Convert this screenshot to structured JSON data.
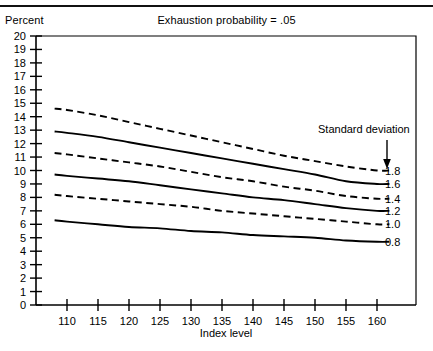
{
  "header": {
    "clipped_text": "",
    "percent_label": "Percent"
  },
  "chart_data": {
    "type": "line",
    "title": "Exhaustion probability = .05",
    "xlabel": "Index level",
    "ylabel": "Percent",
    "xlim": [
      108,
      163
    ],
    "ylim": [
      0,
      20
    ],
    "xticks": [
      110,
      115,
      120,
      125,
      130,
      135,
      140,
      145,
      150,
      155,
      160
    ],
    "yticks": [
      0,
      1,
      2,
      3,
      4,
      5,
      6,
      7,
      8,
      9,
      10,
      11,
      12,
      13,
      14,
      15,
      16,
      17,
      18,
      19,
      20
    ],
    "grid": false,
    "legend_position": "right-inline",
    "legend_title": "Standard deviation",
    "annotation_arrow": "down-arrow-icon",
    "x": [
      108,
      110,
      115,
      120,
      125,
      130,
      135,
      140,
      145,
      150,
      155,
      160,
      162
    ],
    "series": [
      {
        "name": "1.8",
        "label": "1.8",
        "style": "dashed",
        "values": [
          14.6,
          14.5,
          14.1,
          13.6,
          13.1,
          12.6,
          12.1,
          11.6,
          11.1,
          10.7,
          10.3,
          10.0,
          10.0
        ]
      },
      {
        "name": "1.6",
        "label": "1.6",
        "style": "solid",
        "values": [
          12.9,
          12.8,
          12.5,
          12.1,
          11.7,
          11.3,
          10.9,
          10.5,
          10.1,
          9.7,
          9.2,
          9.0,
          9.0
        ]
      },
      {
        "name": "1.4",
        "label": "1.4",
        "style": "dashed",
        "values": [
          11.3,
          11.2,
          10.9,
          10.6,
          10.3,
          9.9,
          9.5,
          9.2,
          8.8,
          8.5,
          8.1,
          7.9,
          7.9
        ]
      },
      {
        "name": "1.2",
        "label": "1.2",
        "style": "solid",
        "values": [
          9.7,
          9.6,
          9.4,
          9.2,
          8.9,
          8.6,
          8.3,
          8.0,
          7.8,
          7.5,
          7.2,
          7.0,
          7.0
        ]
      },
      {
        "name": "1.0",
        "label": "1.0",
        "style": "dashed",
        "values": [
          8.2,
          8.1,
          7.9,
          7.7,
          7.5,
          7.3,
          7.0,
          6.8,
          6.6,
          6.4,
          6.2,
          6.0,
          6.0
        ]
      },
      {
        "name": "0.8",
        "label": "0.8",
        "style": "solid",
        "values": [
          6.3,
          6.2,
          6.0,
          5.8,
          5.7,
          5.5,
          5.4,
          5.2,
          5.1,
          5.0,
          4.8,
          4.7,
          4.7
        ]
      }
    ]
  }
}
